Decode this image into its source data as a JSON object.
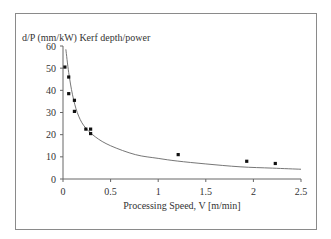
{
  "chart_data": {
    "type": "scatter",
    "title": "",
    "ylabel": "d/P (mm/kW) Kerf depth/power",
    "xlabel": "Processing Speed, V [m/min]",
    "xlim": [
      0,
      2.5
    ],
    "ylim": [
      0,
      60
    ],
    "x_ticks": [
      "0",
      "0.5",
      "1",
      "1.5",
      "2",
      "2.5"
    ],
    "y_ticks": [
      "0",
      "10",
      "20",
      "30",
      "40",
      "50",
      "60"
    ],
    "grid": false,
    "legend": null,
    "series": [
      {
        "name": "measured",
        "kind": "scatter",
        "points": [
          {
            "x": 0.02,
            "y": 50.5
          },
          {
            "x": 0.06,
            "y": 46
          },
          {
            "x": 0.06,
            "y": 38.5
          },
          {
            "x": 0.12,
            "y": 35.5
          },
          {
            "x": 0.12,
            "y": 30.5
          },
          {
            "x": 0.24,
            "y": 22.5
          },
          {
            "x": 0.29,
            "y": 22.5
          },
          {
            "x": 0.29,
            "y": 20.5
          },
          {
            "x": 1.21,
            "y": 11
          },
          {
            "x": 1.93,
            "y": 8
          },
          {
            "x": 2.23,
            "y": 7
          }
        ]
      },
      {
        "name": "fit",
        "kind": "line",
        "points": [
          {
            "x": 0.03,
            "y": 58.5
          },
          {
            "x": 0.06,
            "y": 48
          },
          {
            "x": 0.1,
            "y": 38
          },
          {
            "x": 0.15,
            "y": 30
          },
          {
            "x": 0.22,
            "y": 24
          },
          {
            "x": 0.34,
            "y": 19
          },
          {
            "x": 0.5,
            "y": 15
          },
          {
            "x": 0.76,
            "y": 11
          },
          {
            "x": 1.0,
            "y": 9.3
          },
          {
            "x": 1.2,
            "y": 8.1
          },
          {
            "x": 1.5,
            "y": 6.8
          },
          {
            "x": 1.86,
            "y": 5.5
          },
          {
            "x": 2.2,
            "y": 4.9
          },
          {
            "x": 2.5,
            "y": 4.4
          }
        ]
      }
    ]
  }
}
